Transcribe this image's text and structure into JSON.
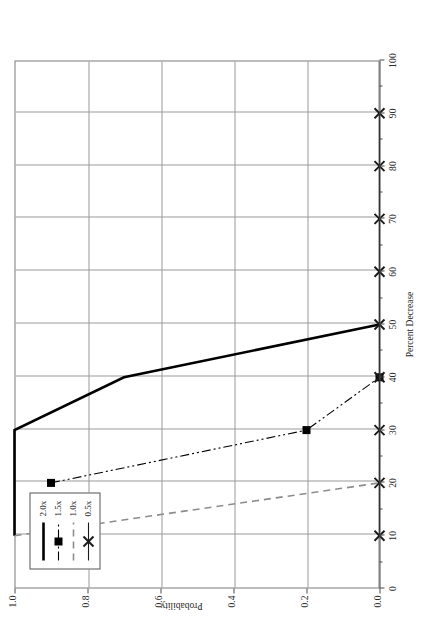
{
  "chart_data": {
    "type": "line",
    "title": "",
    "subtitle": "",
    "xlabel": "Percent Decrease",
    "ylabel": "Probability",
    "xlim": [
      0,
      100
    ],
    "ylim": [
      0,
      1.0
    ],
    "x_ticks": [
      0,
      10,
      20,
      30,
      40,
      50,
      60,
      70,
      80,
      90,
      100
    ],
    "x_tick_labels": [
      "0",
      "10",
      "20",
      "30",
      "40",
      "50",
      "60",
      "70",
      "80",
      "90",
      "100"
    ],
    "y_ticks": [
      0.0,
      0.2,
      0.4,
      0.6,
      0.8,
      1.0
    ],
    "y_tick_labels": [
      "0.0",
      "0.2",
      "0.4",
      "0.6",
      "0.8",
      "1.0"
    ],
    "grid": true,
    "legend_position": "top-left",
    "orientation": "rotated-90-ccw",
    "series": [
      {
        "name": "2.0x",
        "style": "solid",
        "color": "#000000",
        "marker": "none",
        "linewidth": 2.6,
        "x": [
          10,
          30,
          40,
          50
        ],
        "y": [
          1.0,
          1.0,
          0.7,
          0.0
        ]
      },
      {
        "name": "1.5x",
        "style": "dash-dot-dot",
        "color": "#000000",
        "marker": "square",
        "linewidth": 1.1,
        "x": [
          20,
          30,
          40
        ],
        "y": [
          0.9,
          0.2,
          0.0
        ]
      },
      {
        "name": "1.0x",
        "style": "dashed",
        "color": "#8c8c8c",
        "marker": "none",
        "linewidth": 1.6,
        "x": [
          10,
          20
        ],
        "y": [
          1.0,
          0.0
        ]
      },
      {
        "name": "0.5x",
        "style": "solid-with-x",
        "color": "#1a1a1a",
        "marker": "x",
        "linewidth": 1.1,
        "x": [
          10,
          20,
          30,
          40,
          50,
          60,
          70,
          80,
          90
        ],
        "y": [
          0.0,
          0.0,
          0.0,
          0.0,
          0.0,
          0.0,
          0.0,
          0.0,
          0.0
        ]
      }
    ],
    "legend_entries": [
      {
        "label": "2.0x"
      },
      {
        "label": "1.5x"
      },
      {
        "label": "1.0x"
      },
      {
        "label": "0.5x"
      }
    ]
  }
}
